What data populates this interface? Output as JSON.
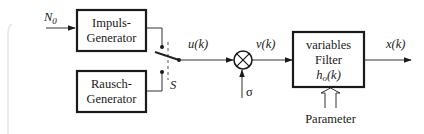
{
  "diagram": {
    "type": "block-diagram",
    "inputs": {
      "n0": {
        "base": "N",
        "sub": "0"
      },
      "sigma": "σ",
      "parameter": "Parameter"
    },
    "blocks": {
      "impulse_generator": {
        "line1": "Impuls-",
        "line2": "Generator"
      },
      "noise_generator": {
        "line1": "Rausch-",
        "line2": "Generator"
      },
      "variable_filter": {
        "line1": "variables",
        "line2": "Filter",
        "line3_base": "h",
        "line3_sub": "o",
        "line3_rest": "(k)"
      }
    },
    "switch": {
      "label": "S"
    },
    "signals": {
      "u": "u(k)",
      "v": "v(k)",
      "x": "x(k)"
    },
    "multiplier": {
      "symbol": "⊗"
    },
    "colors": {
      "stroke": "#1a1a1a",
      "background": "#ffffff"
    }
  }
}
